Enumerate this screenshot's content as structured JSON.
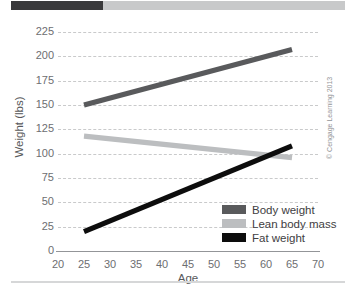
{
  "decor": {
    "topbar_dark_color": "#3a3a3c",
    "topbar_light_color": "#c8c9ca",
    "bottom_rule_color": "#d6d7d8"
  },
  "credit": "© Cengage Learning 2013",
  "chart_data": {
    "type": "line",
    "title": "",
    "xlabel": "Age",
    "ylabel": "Weight (lbs)",
    "xlim": [
      20,
      70
    ],
    "ylim": [
      0,
      225
    ],
    "xticks": [
      20,
      25,
      30,
      35,
      40,
      45,
      50,
      55,
      60,
      65,
      70
    ],
    "yticks": [
      0,
      25,
      50,
      75,
      100,
      125,
      150,
      175,
      200,
      225
    ],
    "grid": "horizontal-dashed",
    "legend_position": "bottom-right",
    "x": [
      25,
      65
    ],
    "series": [
      {
        "name": "Body weight",
        "values": [
          150,
          207
        ],
        "color": "#595a5c"
      },
      {
        "name": "Lean body mass",
        "values": [
          118,
          96
        ],
        "color": "#bcbec0"
      },
      {
        "name": "Fat weight",
        "values": [
          20,
          108
        ],
        "color": "#0d0d0d"
      }
    ],
    "annotations": [
      "Fat weight crosses lean body mass near age 60 at about 100 lbs"
    ]
  }
}
